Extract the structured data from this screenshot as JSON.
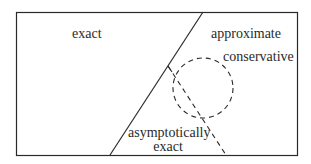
{
  "diagram": {
    "regions": {
      "left_label": "exact",
      "right_label": "approximate",
      "circle_label": "conservative",
      "overlap_label_line1": "asymptotically",
      "overlap_label_line2": "exact"
    },
    "colors": {
      "stroke": "#2a2a2a",
      "background": "#ffffff"
    },
    "shapes": {
      "frame": {
        "x": 16,
        "y": 12,
        "width": 281,
        "height": 143
      },
      "divider_line": {
        "x1": 203,
        "y1": 12,
        "x2": 110,
        "y2": 155,
        "style": "solid"
      },
      "dashed_circle": {
        "cx": 203,
        "cy": 88,
        "r": 30,
        "style": "dashed"
      },
      "dashed_line": {
        "x1": 168,
        "y1": 66,
        "x2": 226,
        "y2": 155,
        "style": "dashed"
      }
    }
  }
}
